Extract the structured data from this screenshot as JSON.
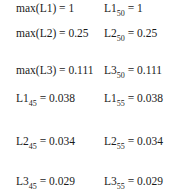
{
  "equations": {
    "rows": [
      {
        "left": {
          "text": "max(L1) = 1"
        },
        "right": {
          "base": "L1",
          "sub": "50",
          "rest": " = 1"
        }
      },
      {
        "left": {
          "text": "max(L2) = 0.25"
        },
        "right": {
          "base": "L2",
          "sub": "50",
          "rest": " = 0.25"
        }
      },
      {
        "left": {
          "text": "max(L3) = 0.111"
        },
        "right": {
          "base": "L3",
          "sub": "50",
          "rest": " = 0.111"
        }
      },
      {
        "left": {
          "base": "L1",
          "sub": "45",
          "rest": " = 0.038"
        },
        "right": {
          "base": "L1",
          "sub": "55",
          "rest": " = 0.038"
        }
      },
      {
        "left": {
          "base": "L2",
          "sub": "45",
          "rest": " = 0.034"
        },
        "right": {
          "base": "L2",
          "sub": "55",
          "rest": " = 0.034"
        }
      },
      {
        "left": {
          "base": "L3",
          "sub": "45",
          "rest": " = 0.029"
        },
        "right": {
          "base": "L3",
          "sub": "55",
          "rest": " = 0.029"
        }
      }
    ]
  }
}
